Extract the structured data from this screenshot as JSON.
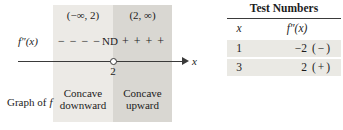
{
  "colors": {
    "region_left_bg": "#eceae6",
    "region_right_bg": "#d9d7d2",
    "table_row_bg": "#eae9e4",
    "line": "#3a3a3a",
    "text": "#1c1c1c"
  },
  "sign_chart": {
    "function_label": "f″(x)",
    "interval_left": "(−∞, 2)",
    "interval_right": "(2, ∞)",
    "negative_signs": "− − − −",
    "nd_label": "ND",
    "positive_signs": "+ + + +",
    "breakpoint_label": "2",
    "axis_label": "x",
    "row_label_prefix": "Graph of",
    "row_label_f": "f",
    "region_left_line1": "Concave",
    "region_left_line2": "downward",
    "region_right_line1": "Concave",
    "region_right_line2": "upward"
  },
  "table": {
    "title": "Test Numbers",
    "headers": {
      "x": "x",
      "fpp": "f″(x)"
    },
    "rows": [
      {
        "x": "1",
        "value": "−2",
        "sign": "(−)"
      },
      {
        "x": "3",
        "value": "2",
        "sign": "(+)"
      }
    ]
  }
}
